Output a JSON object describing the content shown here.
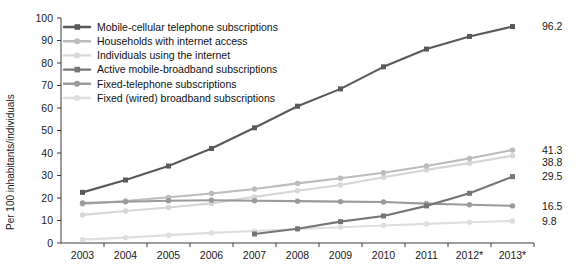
{
  "chart_data": {
    "type": "line",
    "title": "",
    "xlabel": "",
    "ylabel": "Per 100 inhabitants/individuals",
    "ylim": [
      0,
      100
    ],
    "ytick_step": 10,
    "yticks": [
      "0",
      "10",
      "20",
      "30",
      "40",
      "50",
      "60",
      "70",
      "80",
      "90",
      "100"
    ],
    "grid": false,
    "legend_position": "top-left-inside",
    "categories": [
      "2003",
      "2004",
      "2005",
      "2006",
      "2007",
      "2008",
      "2009",
      "2010",
      "2011",
      "2012*",
      "2013*"
    ],
    "series": [
      {
        "name": "Mobile-cellular telephone subscriptions",
        "color": "#595959",
        "marker": "square",
        "end_label": "96.2",
        "values": [
          22.5,
          28.0,
          34.2,
          42.0,
          51.2,
          60.8,
          68.5,
          78.3,
          86.2,
          91.8,
          96.2
        ]
      },
      {
        "name": "Households with internet access",
        "color": "#bcbcbc",
        "marker": "circle",
        "end_label": "41.3",
        "values": [
          17.3,
          18.7,
          20.3,
          22.0,
          24.0,
          26.5,
          28.8,
          31.2,
          34.2,
          37.6,
          41.3
        ]
      },
      {
        "name": "Individuals using the internet",
        "color": "#d6d6d6",
        "marker": "circle",
        "end_label": "38.8",
        "values": [
          12.5,
          14.2,
          15.8,
          17.6,
          20.5,
          23.2,
          25.8,
          29.2,
          32.5,
          35.5,
          38.8
        ]
      },
      {
        "name": "Active mobile-broadband subscriptions",
        "color": "#767676",
        "marker": "square",
        "end_label": "29.5",
        "values": [
          null,
          null,
          null,
          null,
          4.0,
          6.3,
          9.5,
          12.0,
          16.5,
          22.1,
          29.5
        ]
      },
      {
        "name": "Fixed-telephone subscriptions",
        "color": "#9a9a9a",
        "marker": "circle",
        "end_label": "16.5",
        "values": [
          17.8,
          18.3,
          18.8,
          19.0,
          18.8,
          18.6,
          18.4,
          18.2,
          17.5,
          17.0,
          16.5
        ]
      },
      {
        "name": "Fixed (wired) broadband subscriptions",
        "color": "#dedede",
        "marker": "circle",
        "end_label": "9.8",
        "values": [
          1.5,
          2.4,
          3.5,
          4.5,
          5.3,
          6.2,
          7.0,
          7.8,
          8.5,
          9.2,
          9.8
        ]
      }
    ]
  }
}
